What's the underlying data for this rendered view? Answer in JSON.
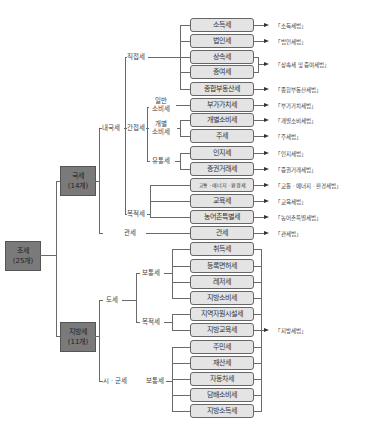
{
  "root": {
    "name": "조세",
    "count": "(25개)"
  },
  "national": {
    "name": "국세",
    "count": "(14개)",
    "categories": {
      "internal": "내국세",
      "direct": "직접세",
      "indirect": "간접세",
      "general_consumption": "일반\n소비세",
      "general_consumption_l1": "일반",
      "general_consumption_l2": "소비세",
      "special_consumption_l1": "개별",
      "special_consumption_l2": "소비세",
      "circulation": "유통세",
      "purpose": "목적세",
      "customs": "관세"
    }
  },
  "local": {
    "name": "지방세",
    "count": "(11개)",
    "categories": {
      "province": "도세",
      "province_ordinary": "보통세",
      "province_purpose": "목적세",
      "city": "시 · 군세",
      "city_ordinary": "보통세"
    }
  },
  "taxes": [
    {
      "name": "소득세"
    },
    {
      "name": "법인세"
    },
    {
      "name": "상속세"
    },
    {
      "name": "증여세"
    },
    {
      "name": "종합부동산세"
    },
    {
      "name": "부가가치세"
    },
    {
      "name": "개별소비세"
    },
    {
      "name": "주세"
    },
    {
      "name": "인지세"
    },
    {
      "name": "증권거래세"
    },
    {
      "name": "교통 · 에너지 · 환경세"
    },
    {
      "name": "교육세"
    },
    {
      "name": "농어촌특별세"
    },
    {
      "name": "관세"
    },
    {
      "name": "취득세"
    },
    {
      "name": "등록면허세"
    },
    {
      "name": "레저세"
    },
    {
      "name": "지방소비세"
    },
    {
      "name": "지역자원시설세"
    },
    {
      "name": "지방교육세"
    },
    {
      "name": "주민세"
    },
    {
      "name": "재산세"
    },
    {
      "name": "자동차세"
    },
    {
      "name": "담배소비세"
    },
    {
      "name": "지방소득세"
    }
  ],
  "laws": [
    "「소득세법」",
    "「법인세법」",
    "「상속세 및 증여세법」",
    "「종합부동산세법」",
    "「부가가치세법」",
    "「개별소비세법」",
    "「주세법」",
    "「인지세법」",
    "「증권거래세법」",
    "「교통 · 에너지 · 환경세법」",
    "「교육세법」",
    "「농어촌특별세법」",
    "「관세법」",
    "「지방세법」"
  ],
  "colors": {
    "group_box": "#7a7a7a",
    "tax_box": "#e4e4e4",
    "line": "#6a6a6a"
  }
}
